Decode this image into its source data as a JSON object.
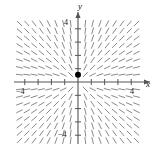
{
  "figure": {
    "kind": "slope-field",
    "background_color": "#ffffff",
    "axis_color": "#555555",
    "segment_color": "#8a8a8a",
    "point_color": "#000000"
  },
  "axes": {
    "x_label": "x",
    "y_label": "y",
    "x_min": -4.6,
    "x_max": 4.6,
    "y_min": -4.6,
    "y_max": 4.6,
    "x_ticks": [
      -4,
      -3,
      -2,
      -1,
      1,
      2,
      3,
      4
    ],
    "y_ticks": [
      -4,
      -3,
      -2,
      -1,
      1,
      2,
      3,
      4
    ],
    "labeled_ticks": {
      "x_negative": "−4",
      "x_positive": "4",
      "y_positive": "4",
      "y_negative": "−4"
    },
    "grid": false,
    "tick_length_px": 3
  },
  "marked_point": {
    "label": "",
    "x": 0,
    "y": 0.55,
    "radius_px": 3
  },
  "chart_data": {
    "type": "scatter",
    "title": "",
    "xlabel": "x",
    "ylabel": "y",
    "xlim": [
      -4.6,
      4.6
    ],
    "ylim": [
      -4.6,
      4.6
    ],
    "grid": false,
    "legend": "none",
    "slope_field": {
      "x_samples": [
        -4.4,
        -3.85,
        -3.3,
        -2.75,
        -2.2,
        -1.65,
        -1.1,
        -0.55,
        0.55,
        1.1,
        1.65,
        2.2,
        2.75,
        3.3,
        3.85,
        4.4
      ],
      "y_samples": [
        4.4,
        3.85,
        3.3,
        2.75,
        2.2,
        1.65,
        1.1,
        0.55,
        -0.55,
        -1.1,
        -1.65,
        -2.2,
        -2.75,
        -3.3,
        -3.85,
        -4.4
      ],
      "segment_length_px": 7,
      "slope_formula": "dy/dx = y/x",
      "notes": "Segments are nearly vertical far from the y-axis and tilt toward the origin near the axes, forming a node/saddle pattern centered at the origin."
    },
    "points": [
      {
        "x": 0,
        "y": 0.55
      }
    ]
  }
}
